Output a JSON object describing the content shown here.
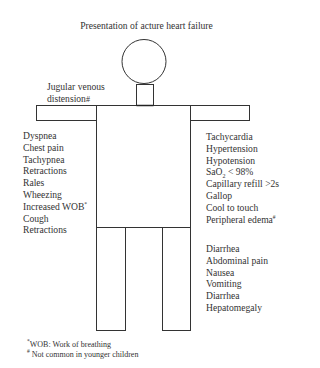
{
  "title": "Presentation of acture heart failure",
  "neck_label": {
    "line1": "Jugular venous",
    "line2": "distension",
    "marker": "#"
  },
  "chest_symptoms": [
    {
      "text": "Dyspnea",
      "marker": ""
    },
    {
      "text": "Chest pain",
      "marker": ""
    },
    {
      "text": "Tachypnea",
      "marker": ""
    },
    {
      "text": "Retractions",
      "marker": ""
    },
    {
      "text": "Rales",
      "marker": ""
    },
    {
      "text": "Wheezing",
      "marker": ""
    },
    {
      "text": "Increased WOB",
      "marker": "*"
    },
    {
      "text": "Cough",
      "marker": ""
    },
    {
      "text": "Retractions",
      "marker": ""
    }
  ],
  "cardiac_signs": [
    {
      "text": "Tachycardia",
      "marker": ""
    },
    {
      "text": "Hypertension",
      "marker": ""
    },
    {
      "text": "Hypotension",
      "marker": ""
    },
    {
      "text": "SaO",
      "sub": "2",
      "after": " < 98%",
      "marker": ""
    },
    {
      "text": "Capillary refill >2s",
      "marker": ""
    },
    {
      "text": "Gallop",
      "marker": ""
    },
    {
      "text": "Cool to touch",
      "marker": ""
    },
    {
      "text": "Peripheral edema",
      "marker": "#"
    }
  ],
  "abdominal_symptoms": [
    {
      "text": "Diarrhea"
    },
    {
      "text": "Abdominal pain"
    },
    {
      "text": "Nausea"
    },
    {
      "text": "Vomiting"
    },
    {
      "text": "Diarrhea"
    },
    {
      "text": "Hepatomegaly"
    }
  ],
  "footnotes": [
    {
      "marker": "*",
      "text": "WOB: Work of breathing"
    },
    {
      "marker": "#",
      "text": " Not common in younger children"
    }
  ],
  "colors": {
    "stroke": "#333333",
    "text": "#333333",
    "background": "#ffffff"
  }
}
